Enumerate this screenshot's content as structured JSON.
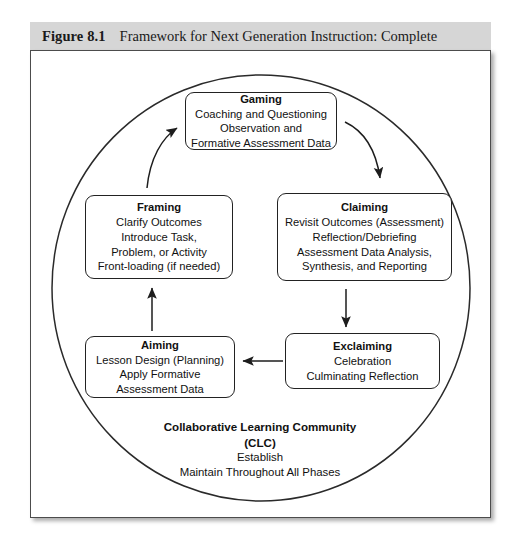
{
  "caption": {
    "number": "Figure 8.1",
    "text": "Framework for Next Generation Instruction: Complete"
  },
  "diagram": {
    "shape": "ellipse",
    "boxes": [
      {
        "id": "gaming",
        "title": "Gaming",
        "lines": [
          "Coaching and Questioning",
          "Observation and",
          "Formative Assessment Data"
        ]
      },
      {
        "id": "framing",
        "title": "Framing",
        "lines": [
          "Clarify Outcomes",
          "Introduce Task,",
          "Problem, or Activity",
          "Front-loading (if needed)"
        ]
      },
      {
        "id": "claiming",
        "title": "Claiming",
        "lines": [
          "Revisit  Outcomes (Assessment)",
          "Reflection/Debriefing",
          "Assessment Data Analysis,",
          "Synthesis, and Reporting"
        ]
      },
      {
        "id": "aiming",
        "title": "Aiming",
        "lines": [
          "Lesson Design (Planning)",
          "Apply Formative",
          "Assessment Data"
        ]
      },
      {
        "id": "exclaiming",
        "title": "Exclaiming",
        "lines": [
          "Celebration",
          "Culminating Reflection"
        ]
      }
    ],
    "center_block": {
      "title_line_1": "Collaborative Learning Community",
      "title_line_2": "(CLC)",
      "lines": [
        "Establish",
        "Maintain Throughout All Phases"
      ]
    },
    "arrows": [
      {
        "name": "framing-to-gaming",
        "style": "curved",
        "direction": "up-right"
      },
      {
        "name": "gaming-to-claiming",
        "style": "curved",
        "direction": "down-right"
      },
      {
        "name": "claiming-to-exclaiming",
        "style": "straight",
        "direction": "down"
      },
      {
        "name": "exclaiming-to-aiming",
        "style": "straight",
        "direction": "left"
      },
      {
        "name": "aiming-to-framing",
        "style": "straight",
        "direction": "up"
      }
    ]
  },
  "colors": {
    "caption_band": "#d6d6d6",
    "panel_border": "#4c4c4c",
    "stroke": "#222222",
    "text": "#111111",
    "background": "#ffffff"
  }
}
